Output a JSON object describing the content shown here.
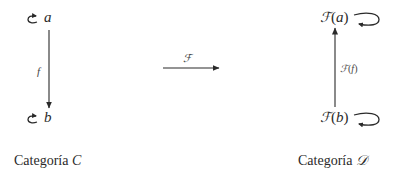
{
  "diagram": {
    "left_category": {
      "caption_prefix": "Categoría",
      "caption_symbol": "C",
      "objects": [
        {
          "id": "a",
          "label": "a",
          "identity_loop": true
        },
        {
          "id": "b",
          "label": "b",
          "identity_loop": true
        }
      ],
      "morphism": {
        "label": "f",
        "from": "a",
        "to": "b",
        "direction": "down"
      }
    },
    "functor": {
      "label": "ℱ",
      "direction": "right"
    },
    "right_category": {
      "caption_prefix": "Categoría",
      "caption_symbol": "𝒟",
      "objects": [
        {
          "id": "Fa",
          "functor": "ℱ",
          "open": "(",
          "arg": "a",
          "close": ")",
          "identity_loop": true
        },
        {
          "id": "Fb",
          "functor": "ℱ",
          "open": "(",
          "arg": "b",
          "close": ")",
          "identity_loop": true
        }
      ],
      "morphism": {
        "functor": "ℱ",
        "open": "(",
        "arg": "f",
        "close": ")",
        "from": "Fb",
        "to": "Fa",
        "direction": "up"
      }
    },
    "colors": {
      "stroke": "#2a2a2a",
      "text": "#2a2a2a",
      "background": "#ffffff"
    }
  }
}
